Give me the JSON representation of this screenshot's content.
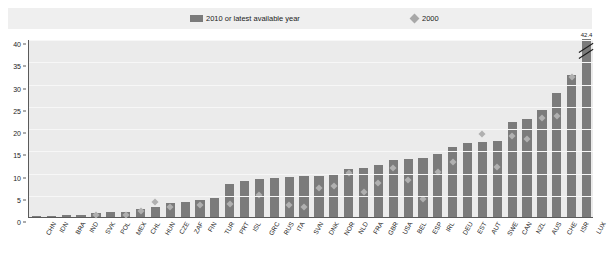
{
  "legend": {
    "bar_label": "2010 or latest available year",
    "diamond_label": "2000",
    "bar_icon": "bar-swatch-icon",
    "diamond_icon": "diamond-swatch-icon"
  },
  "axis": {
    "y_ticks": [
      "0",
      "5",
      "10",
      "15",
      "20",
      "25",
      "30",
      "35",
      "40"
    ]
  },
  "annotation": {
    "lux_value": "42.4"
  },
  "colors": {
    "bar": "#7b7b7b",
    "diamond": "#b0b0b0",
    "plot_background": "#ebebeb",
    "legend_background": "#efefef",
    "axis": "#5a5a5a",
    "text": "#1c1c1c"
  },
  "chart_data": {
    "type": "bar",
    "title": "",
    "subtitle": "",
    "xlabel": "",
    "ylabel": "",
    "ylim": [
      0,
      40
    ],
    "grid": true,
    "legend_position": "top",
    "categories": [
      "CHN",
      "IDN",
      "BRA",
      "IND",
      "SVK",
      "POL",
      "MEX",
      "CHL",
      "HUN",
      "CZE",
      "ZAF",
      "FIN",
      "TUR",
      "PRT",
      "ISL",
      "GRC",
      "RUS",
      "ITA",
      "SVN",
      "DNK",
      "NOR",
      "NLD",
      "FRA",
      "GBR",
      "USA",
      "BEL",
      "ESP",
      "IRL",
      "DEU",
      "EST",
      "AUT",
      "SWE",
      "CAN",
      "NZL",
      "AUS",
      "CHE",
      "ISR",
      "LUX"
    ],
    "series": [
      {
        "name": "2010 or latest available year",
        "type": "bar",
        "values": [
          0.1,
          0.2,
          0.4,
          0.5,
          0.8,
          1.1,
          1.1,
          1.9,
          2.2,
          3.2,
          3.4,
          3.9,
          4.3,
          7.5,
          8.1,
          8.5,
          8.7,
          9.0,
          9.3,
          9.3,
          9.4,
          10.7,
          11.1,
          11.7,
          12.8,
          13.0,
          13.2,
          14.2,
          15.8,
          16.6,
          16.9,
          17.0,
          21.3,
          22.0,
          24.0,
          27.8,
          32.0,
          42.4
        ]
      },
      {
        "name": "2000",
        "type": "scatter",
        "values": [
          null,
          null,
          null,
          null,
          0.5,
          null,
          0.5,
          1.4,
          3.3,
          2.3,
          null,
          2.7,
          null,
          2.9,
          null,
          4.9,
          null,
          2.6,
          2.2,
          6.5,
          6.9,
          10.0,
          5.7,
          7.6,
          11.0,
          8.4,
          4.1,
          10.1,
          12.3,
          null,
          18.6,
          11.2,
          18.1,
          17.6,
          22.2,
          22.6,
          31.5,
          null
        ]
      }
    ],
    "annotations": [
      {
        "category": "LUX",
        "text": "42.4",
        "note": "axis-break; bar truncated at top of plot"
      }
    ]
  }
}
